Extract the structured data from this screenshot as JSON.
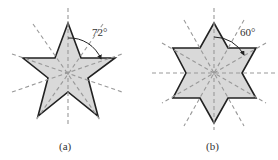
{
  "figures": [
    {
      "id": "a",
      "caption": "(a)",
      "shape": "five-pointed star",
      "angle_label": "72°",
      "fill_color": "#d9d9d9",
      "outline_color": "#222222",
      "axis_color": "#999999",
      "symmetry_axes": 5
    },
    {
      "id": "b",
      "caption": "(b)",
      "shape": "six-pointed star",
      "angle_label": "60°",
      "fill_color": "#d9d9d9",
      "outline_color": "#222222",
      "axis_color": "#999999",
      "symmetry_axes": 6
    }
  ]
}
